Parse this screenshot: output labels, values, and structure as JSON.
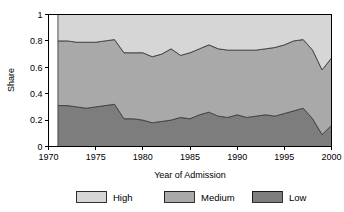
{
  "chart_data": {
    "type": "area",
    "stacked": true,
    "stacked_to_one": true,
    "title": "",
    "subtitle": "",
    "xlabel": "Year of Admission",
    "ylabel": "Share",
    "xlim": [
      1970,
      2000
    ],
    "ylim": [
      0,
      1
    ],
    "grid": false,
    "legend_position": "bottom",
    "x": [
      1971,
      1972,
      1973,
      1974,
      1975,
      1976,
      1977,
      1978,
      1979,
      1980,
      1981,
      1982,
      1983,
      1984,
      1985,
      1986,
      1987,
      1988,
      1989,
      1990,
      1991,
      1992,
      1993,
      1994,
      1995,
      1996,
      1997,
      1998,
      1999,
      2000
    ],
    "xticks": [
      1970,
      1975,
      1980,
      1985,
      1990,
      1995,
      2000
    ],
    "xticklabels": [
      "1970",
      "1975",
      "1980",
      "1985",
      "1990",
      "1995",
      "2000"
    ],
    "yticks": [
      0,
      0.2,
      0.4,
      0.6,
      0.8,
      1
    ],
    "yticklabels": [
      "0",
      "0.2",
      "0.4",
      "0.6",
      "0.8",
      "1"
    ],
    "series": [
      {
        "name": "Low",
        "color": "#7d7d7d",
        "order": 0,
        "values": [
          0.31,
          0.31,
          0.3,
          0.29,
          0.3,
          0.31,
          0.32,
          0.21,
          0.21,
          0.2,
          0.18,
          0.19,
          0.2,
          0.22,
          0.21,
          0.24,
          0.26,
          0.23,
          0.22,
          0.24,
          0.22,
          0.23,
          0.24,
          0.23,
          0.25,
          0.27,
          0.29,
          0.21,
          0.09,
          0.16
        ]
      },
      {
        "name": "Medium",
        "color": "#a9a9a9",
        "order": 1,
        "values": [
          0.49,
          0.49,
          0.49,
          0.5,
          0.49,
          0.49,
          0.49,
          0.5,
          0.5,
          0.51,
          0.5,
          0.51,
          0.54,
          0.47,
          0.5,
          0.5,
          0.51,
          0.51,
          0.51,
          0.49,
          0.51,
          0.5,
          0.5,
          0.52,
          0.52,
          0.53,
          0.52,
          0.52,
          0.49,
          0.51
        ]
      },
      {
        "name": "High",
        "color": "#d6d6d6",
        "order": 2,
        "values": [
          0.2,
          0.2,
          0.21,
          0.21,
          0.21,
          0.2,
          0.19,
          0.29,
          0.29,
          0.29,
          0.32,
          0.3,
          0.26,
          0.31,
          0.29,
          0.26,
          0.23,
          0.26,
          0.27,
          0.27,
          0.27,
          0.27,
          0.26,
          0.25,
          0.23,
          0.2,
          0.19,
          0.27,
          0.42,
          0.33
        ]
      }
    ],
    "cumulative_low": [
      0.31,
      0.31,
      0.3,
      0.29,
      0.3,
      0.31,
      0.32,
      0.21,
      0.21,
      0.2,
      0.18,
      0.19,
      0.2,
      0.22,
      0.21,
      0.24,
      0.26,
      0.23,
      0.22,
      0.24,
      0.22,
      0.23,
      0.24,
      0.23,
      0.25,
      0.27,
      0.29,
      0.21,
      0.09,
      0.16
    ],
    "cumulative_low_medium": [
      0.8,
      0.8,
      0.79,
      0.79,
      0.79,
      0.8,
      0.81,
      0.71,
      0.71,
      0.71,
      0.68,
      0.7,
      0.74,
      0.69,
      0.71,
      0.74,
      0.77,
      0.74,
      0.73,
      0.73,
      0.73,
      0.73,
      0.74,
      0.75,
      0.77,
      0.8,
      0.81,
      0.73,
      0.58,
      0.67
    ]
  },
  "legend": {
    "entries": [
      {
        "label": "High",
        "color": "#d6d6d6"
      },
      {
        "label": "Medium",
        "color": "#a9a9a9"
      },
      {
        "label": "Low",
        "color": "#7d7d7d"
      }
    ]
  },
  "axes": {
    "ylabel": "Share",
    "xlabel": "Year of Admission"
  }
}
